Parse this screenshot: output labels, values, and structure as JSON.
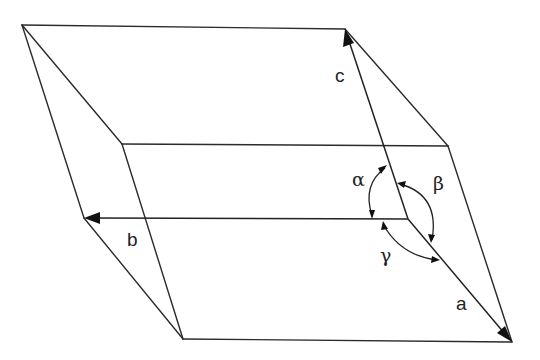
{
  "diagram": {
    "type": "crystallographic-unit-cell",
    "colors": {
      "line": "#2b2b2b",
      "background": "#ffffff"
    },
    "vectors": [
      {
        "id": "a",
        "label": "a",
        "from": [
          408,
          219
        ],
        "to": [
          512,
          342
        ]
      },
      {
        "id": "b",
        "label": "b",
        "from": [
          408,
          219
        ],
        "to": [
          84,
          218
        ]
      },
      {
        "id": "c",
        "label": "c",
        "from": [
          408,
          219
        ],
        "to": [
          345,
          29
        ]
      }
    ],
    "angles": [
      {
        "id": "alpha",
        "label": "α",
        "between": [
          "b",
          "c"
        ]
      },
      {
        "id": "beta",
        "label": "β",
        "between": [
          "a",
          "c"
        ]
      },
      {
        "id": "gamma",
        "label": "γ",
        "between": [
          "a",
          "b"
        ]
      }
    ],
    "labels": {
      "a": "a",
      "b": "b",
      "c": "c",
      "alpha": "α",
      "beta": "β",
      "gamma": "γ"
    }
  }
}
